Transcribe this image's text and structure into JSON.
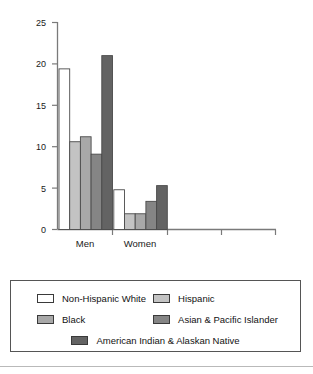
{
  "chart_data": {
    "type": "bar",
    "title": "",
    "subtitle": "",
    "xlabel": "",
    "ylabel": "",
    "categories": [
      "Men",
      "Women"
    ],
    "series": [
      {
        "name": "Non-Hispanic White",
        "color": "#ffffff",
        "values": [
          19.4,
          4.8
        ]
      },
      {
        "name": "Hispanic",
        "color": "#c3c3c3",
        "values": [
          10.6,
          1.9
        ]
      },
      {
        "name": "Black",
        "color": "#a8a8a8",
        "values": [
          11.2,
          1.9
        ]
      },
      {
        "name": "Asian & Pacific Islander",
        "color": "#858585",
        "values": [
          9.1,
          3.4
        ]
      },
      {
        "name": "American Indian & Alaskan Native",
        "color": "#636363",
        "values": [
          21.0,
          5.3
        ]
      }
    ],
    "ylim": [
      0,
      25
    ],
    "yticks": [
      0,
      5,
      10,
      15,
      20,
      25
    ],
    "ytick_labels": [
      "0",
      "5",
      "10",
      "15",
      "20",
      "25"
    ],
    "grid": false,
    "legend_position": "below",
    "empty_category_slots": 2,
    "bar_edge_color": "#4a4a4a",
    "axis_color": "#7a7a7a"
  },
  "axis": {
    "y_labels": [
      "25",
      "20",
      "15",
      "10",
      "5",
      "0"
    ],
    "x_labels": [
      "Men",
      "Women"
    ]
  },
  "legend": {
    "rows": [
      {
        "a_label": "Non-Hispanic White",
        "a_color": "#ffffff",
        "b_label": "Hispanic",
        "b_color": "#c3c3c3"
      },
      {
        "a_label": "Black",
        "a_color": "#a8a8a8",
        "b_label": "Asian & Pacific Islander",
        "b_color": "#858585"
      }
    ],
    "last_label": "American Indian & Alaskan Native",
    "last_color": "#636363"
  }
}
